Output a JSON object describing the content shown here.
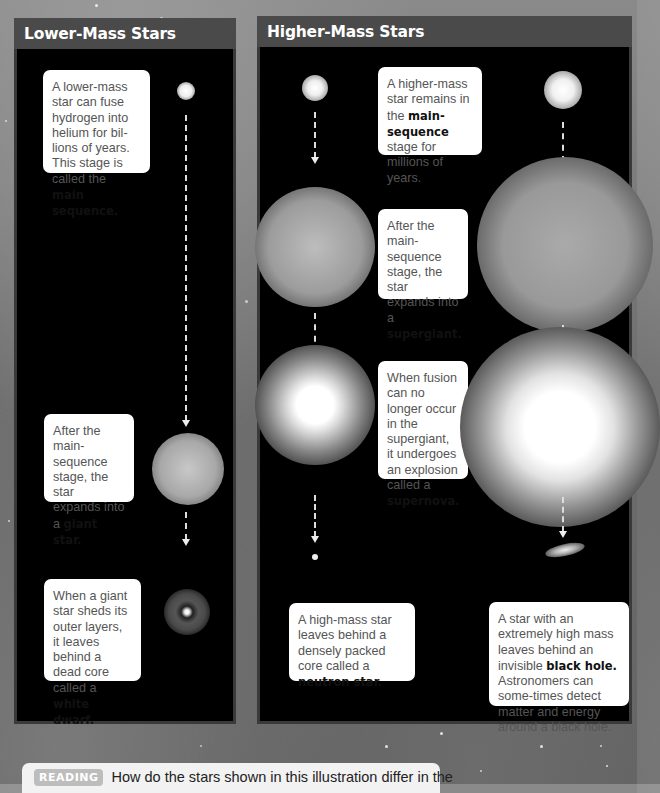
{
  "panels": {
    "lower": {
      "title": "Lower-Mass Stars",
      "stages": [
        {
          "text": "A lower-mass star can fuse hydrogen into helium for bil-lions of years. This stage is called the",
          "term": "main sequence.",
          "object": "main-sequence-star"
        },
        {
          "text": "After the main-sequence stage, the star expands into a",
          "term": "giant star.",
          "object": "giant-star"
        },
        {
          "text": "When a giant star sheds its outer layers, it leaves behind a dead core called a",
          "term": "white dwarf.",
          "object": "white-dwarf"
        }
      ]
    },
    "higher": {
      "title": "Higher-Mass Stars",
      "stages": [
        {
          "pre": "A higher-mass star remains in the",
          "term": "main-sequence",
          "post": "stage for millions of years.",
          "object": "main-sequence-star"
        },
        {
          "text": "After the main-sequence stage, the star expands into a",
          "term": "supergiant.",
          "object": "supergiant"
        },
        {
          "text": "When fusion can no longer occur in the supergiant, it undergoes an explosion called a",
          "term": "supernova.",
          "object": "supernova"
        },
        {
          "text": "A high-mass star leaves behind a densely packed core called a",
          "term": "neutron star.",
          "object": "neutron-star"
        },
        {
          "pre": "A star with an extremely high mass leaves behind an invisible",
          "term": "black hole.",
          "post": "Astronomers can some-times detect matter and energy around a black hole.",
          "object": "black-hole"
        }
      ]
    }
  },
  "reading": {
    "tag": "READING",
    "question": "How do the stars shown in this illustration differ in the"
  },
  "colors": {
    "panel_header": "#4a4a4a",
    "panel_bg": "#000000",
    "callout_bg": "#ffffff",
    "reading_tag_bg": "#bdbdbd"
  }
}
